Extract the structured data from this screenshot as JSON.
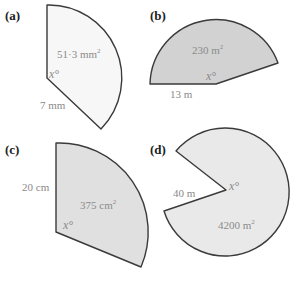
{
  "figures": [
    {
      "id": "a",
      "part_label": "(a)",
      "area_label": "51·3 mm",
      "area_exp": "2",
      "radius_label": "7 mm",
      "angle_label": "x°",
      "fill": "#f7f7f7"
    },
    {
      "id": "b",
      "part_label": "(b)",
      "area_label": "230 m",
      "area_exp": "2",
      "radius_label": "13 m",
      "angle_label": "x°",
      "fill": "#d2d2d2"
    },
    {
      "id": "c",
      "part_label": "(c)",
      "area_label": "375 cm",
      "area_exp": "2",
      "radius_label": "20 cm",
      "angle_label": "x°",
      "fill": "#e0e0e0"
    },
    {
      "id": "d",
      "part_label": "(d)",
      "area_label": "4200 m",
      "area_exp": "2",
      "radius_label": "40 m",
      "angle_label": "x°",
      "fill": "#e9e9e9"
    }
  ]
}
